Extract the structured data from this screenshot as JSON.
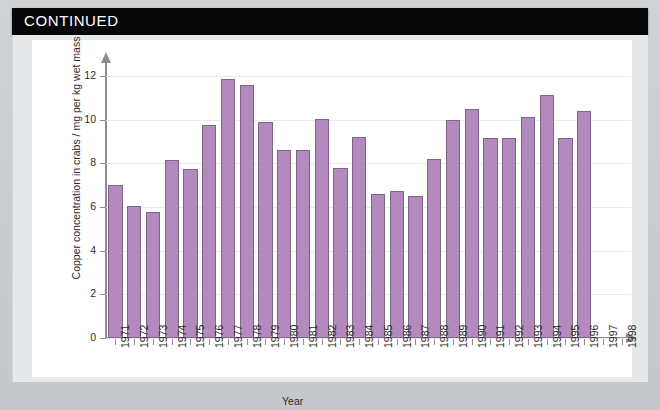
{
  "header": {
    "title": "CONTINUED"
  },
  "chart_data": {
    "type": "bar",
    "title": "",
    "xlabel": "Year",
    "ylabel": "Copper concentration in crabs / mg per kg wet mass",
    "ylim": [
      0,
      12.6
    ],
    "yticks": [
      0,
      2,
      4,
      6,
      8,
      10,
      12
    ],
    "grid": true,
    "legend": "none",
    "categories": [
      "1971",
      "1972",
      "1973",
      "1974",
      "1975",
      "1976",
      "1977",
      "1978",
      "1979",
      "1980",
      "1981",
      "1982",
      "1983",
      "1984",
      "1985",
      "1986",
      "1987",
      "1988",
      "1989",
      "1990",
      "1991",
      "1992",
      "1993",
      "1994",
      "1995",
      "1996",
      "1997",
      "1998"
    ],
    "values": [
      7.0,
      6.05,
      5.75,
      8.15,
      7.75,
      9.75,
      11.85,
      11.6,
      9.9,
      8.6,
      8.6,
      10.05,
      7.8,
      9.2,
      6.6,
      6.75,
      6.5,
      8.2,
      10.0,
      10.5,
      9.15,
      9.15,
      10.1,
      11.15,
      9.15,
      10.4,
      null,
      null
    ],
    "bar_color": "#b489bd",
    "bar_edge_color": "#7d6685",
    "axis_color": "#8d8d8f",
    "gridline_color": "#eceaee",
    "panel_background": "#ffffff"
  }
}
